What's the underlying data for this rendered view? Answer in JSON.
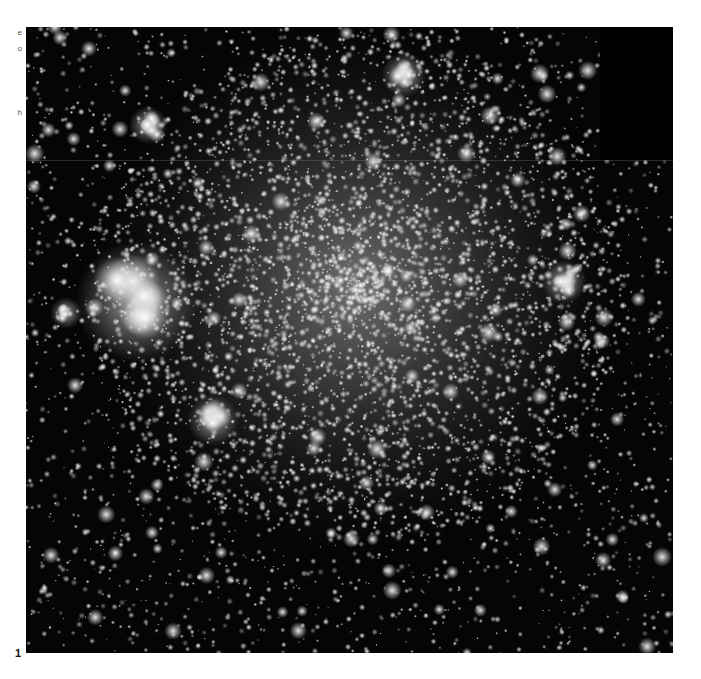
{
  "figure": {
    "panel_label": "1",
    "clipped_margin_text": [
      {
        "text": "e",
        "top": 28
      },
      {
        "text": "o",
        "top": 44
      },
      {
        "text": "h",
        "top": 108
      }
    ]
  },
  "image": {
    "subject": "globular star cluster",
    "colorscale": "grayscale",
    "background_color": "#050505",
    "core_center": {
      "x": 330,
      "y": 260
    },
    "core_radius": 190,
    "bright_clumps": [
      {
        "x": 110,
        "y": 275,
        "r": 38
      },
      {
        "x": 187,
        "y": 393,
        "r": 16
      },
      {
        "x": 122,
        "y": 98,
        "r": 12
      },
      {
        "x": 538,
        "y": 255,
        "r": 14
      },
      {
        "x": 378,
        "y": 48,
        "r": 14
      },
      {
        "x": 40,
        "y": 286,
        "r": 10
      }
    ],
    "dark_corner": {
      "x": 574,
      "y": 0,
      "w": 73,
      "h": 133
    },
    "mosaic_seam_y": 133
  }
}
